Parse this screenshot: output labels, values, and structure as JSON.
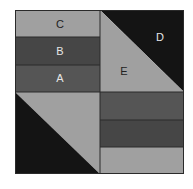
{
  "diagram": {
    "type": "quilt-block",
    "colors": {
      "light_gray": "#a0a0a0",
      "mid_dark": "#555555",
      "dark": "#464646",
      "black": "#141414",
      "border": "#2a2a2a",
      "label_dark": "#222222",
      "label_light": "#e6e6e6"
    },
    "labels": {
      "a": "A",
      "b": "B",
      "c": "C",
      "d": "D",
      "e": "E"
    }
  }
}
